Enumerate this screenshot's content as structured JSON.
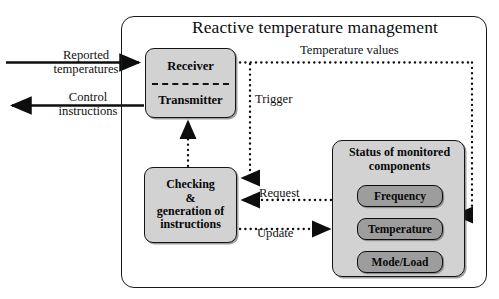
{
  "diagram": {
    "title": "Reactive temperature management",
    "type": "block-diagram",
    "top_cut_text": "",
    "outer_container_name": "Reactive temperature management"
  },
  "blocks": {
    "receiver": "Receiver",
    "transmitter": "Transmitter",
    "checking": [
      "Checking",
      "&",
      "generation of",
      "instructions"
    ],
    "checking_flat": "Checking & generation of instructions",
    "status_panel_title": [
      "Status of monitored",
      "components"
    ],
    "status_panel_title_flat": "Status of monitored components",
    "monitored": [
      {
        "label": "Frequency"
      },
      {
        "label": "Temperature"
      },
      {
        "label": "Mode/Load"
      }
    ]
  },
  "edges": {
    "reported_temperatures": [
      "Reported",
      "temperatures"
    ],
    "reported_temperatures_flat": "Reported temperatures",
    "control_instructions": [
      "Control",
      "instructions"
    ],
    "control_instructions_flat": "Control instructions",
    "temperature_values": "Temperature values",
    "trigger": "Trigger",
    "request": "Request",
    "update": "Update"
  },
  "colors": {
    "box_fill": "#d2d2d2",
    "subbox_fill": "#9d9d9d",
    "stroke": "#141414",
    "background": "#ffffff",
    "text": "#0d0d0d"
  }
}
